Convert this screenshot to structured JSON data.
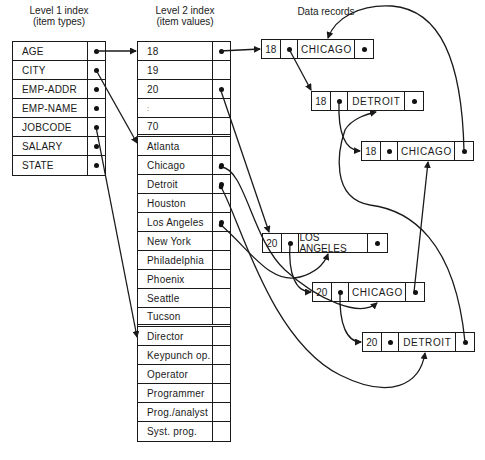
{
  "captions": {
    "level1_title": "Level 1 index",
    "level1_subtitle": "(item types)",
    "level2_title": "Level 2 index",
    "level2_subtitle": "(item values)",
    "data_records": "Data records"
  },
  "level1_index": [
    {
      "label": "AGE"
    },
    {
      "label": "CITY"
    },
    {
      "label": "EMP-ADDR"
    },
    {
      "label": "EMP-NAME"
    },
    {
      "label": "JOBCODE"
    },
    {
      "label": "SALARY"
    },
    {
      "label": "STATE"
    }
  ],
  "level2_index": {
    "age_values": [
      "18",
      "19",
      "20",
      ":",
      "70"
    ],
    "city_values": [
      "Atlanta",
      "Chicago",
      "Detroit",
      "Houston",
      "Los Angeles",
      "New York",
      "Philadelphia",
      "Phoenix",
      "Seattle",
      "Tucson"
    ],
    "jobcode_values": [
      "Director",
      "Keypunch op.",
      "Operator",
      "Programmer",
      "Prog./analyst",
      "Syst. prog."
    ]
  },
  "data_records": [
    {
      "age": "18",
      "city": "CHICAGO"
    },
    {
      "age": "18",
      "city": "DETROIT"
    },
    {
      "age": "18",
      "city": "CHICAGO"
    },
    {
      "age": "20",
      "city": "LOS ANGELES"
    },
    {
      "age": "20",
      "city": "CHICAGO"
    },
    {
      "age": "20",
      "city": "DETROIT"
    }
  ],
  "colors": {
    "line": "#1a1a1a",
    "background": "#ffffff"
  }
}
